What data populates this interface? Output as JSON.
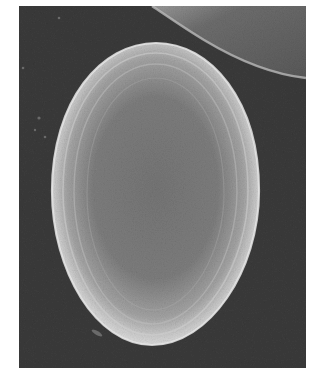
{
  "image": {
    "kind": "scanning electron micrograph",
    "subject": "ovoid grain (pollen grain / egg) with concentric ridged surface",
    "colors": {
      "page_background": "#ffffff",
      "micrograph_background": "#3a3a3a",
      "grain_rim": "#d8d8d8",
      "grain_center": "#7a7a7a",
      "adjacent_object": "#6a6a6a"
    }
  }
}
